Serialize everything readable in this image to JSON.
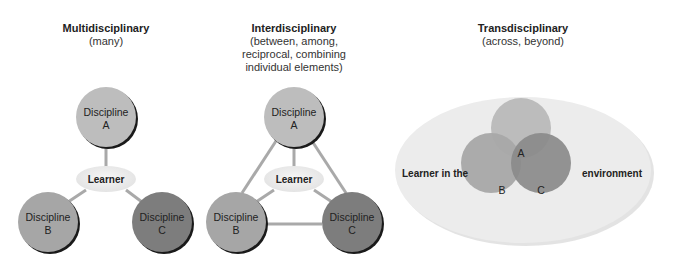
{
  "panels": [
    {
      "title": "Multidisciplinary",
      "subtitle": [
        "(many)"
      ],
      "center_label": "Learner",
      "nodes": [
        {
          "line1": "Discipline",
          "line2": "A",
          "color": "#bdbdbd"
        },
        {
          "line1": "Discipline",
          "line2": "B",
          "color": "#a6a6a6"
        },
        {
          "line1": "Discipline",
          "line2": "C",
          "color": "#7d7d7d"
        }
      ]
    },
    {
      "title": "Interdisciplinary",
      "subtitle": [
        "(between, among,",
        "reciprocal, combining",
        "individual elements)"
      ],
      "center_label": "Learner",
      "nodes": [
        {
          "line1": "Discipline",
          "line2": "A",
          "color": "#bdbdbd"
        },
        {
          "line1": "Discipline",
          "line2": "B",
          "color": "#a6a6a6"
        },
        {
          "line1": "Discipline",
          "line2": "C",
          "color": "#7d7d7d"
        }
      ]
    },
    {
      "title": "Transdisciplinary",
      "subtitle": [
        "(across, beyond)"
      ],
      "left_label": "Learner in the",
      "right_label": "environment",
      "nodes": [
        {
          "label": "A",
          "color": "#bcbcbc"
        },
        {
          "label": "B",
          "color": "#a8a8a8"
        },
        {
          "label": "C",
          "color": "#8a8a8a"
        }
      ]
    }
  ]
}
